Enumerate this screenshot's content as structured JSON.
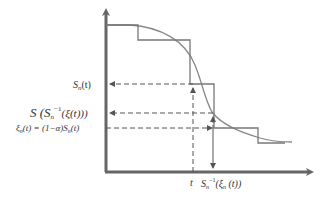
{
  "diagram": {
    "labels": {
      "sn_t": "S",
      "sn_t_sub": "n",
      "sn_t_arg": "(t)",
      "s_inv": "S",
      "s_inv_full": "S (S",
      "s_inv_sub": "n",
      "s_inv_sup": "−1",
      "s_inv_arg": "(ξ(t)))",
      "xi_lhs": "ξ",
      "xi_sub": "n",
      "xi_rest": "(t) = (1−α)S",
      "xi_sub2": "n",
      "xi_arg": "(t)",
      "t_label": "t",
      "inv_label": "S",
      "inv_sub": "n",
      "inv_sup": "−1",
      "inv_arg": "(ξ",
      "inv_arg_sub": "n",
      "inv_arg_end": " (t))"
    },
    "colors": {
      "axis": "#666666",
      "line": "#777777",
      "dashed": "#555555"
    }
  }
}
